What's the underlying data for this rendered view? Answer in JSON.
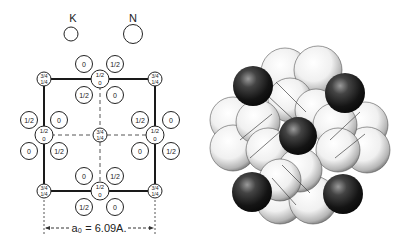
{
  "legend": {
    "k_label": "K",
    "n_label": "N"
  },
  "unit_cell": {
    "corner_label_top": "3/4",
    "corner_label_bottom": "1/4",
    "center_label_top": "3/4",
    "center_label_bottom": "1/4",
    "edge_label_top": "1/2",
    "edge_label_bottom": "0",
    "n_labels": {
      "zero": "0",
      "half": "1/2"
    }
  },
  "dimension": {
    "text": "a₀ = 6.09A."
  },
  "colors": {
    "line": "#1a1a1a",
    "dark_sphere": "#1c1c1c",
    "light_sphere": "#f2f2f2"
  }
}
